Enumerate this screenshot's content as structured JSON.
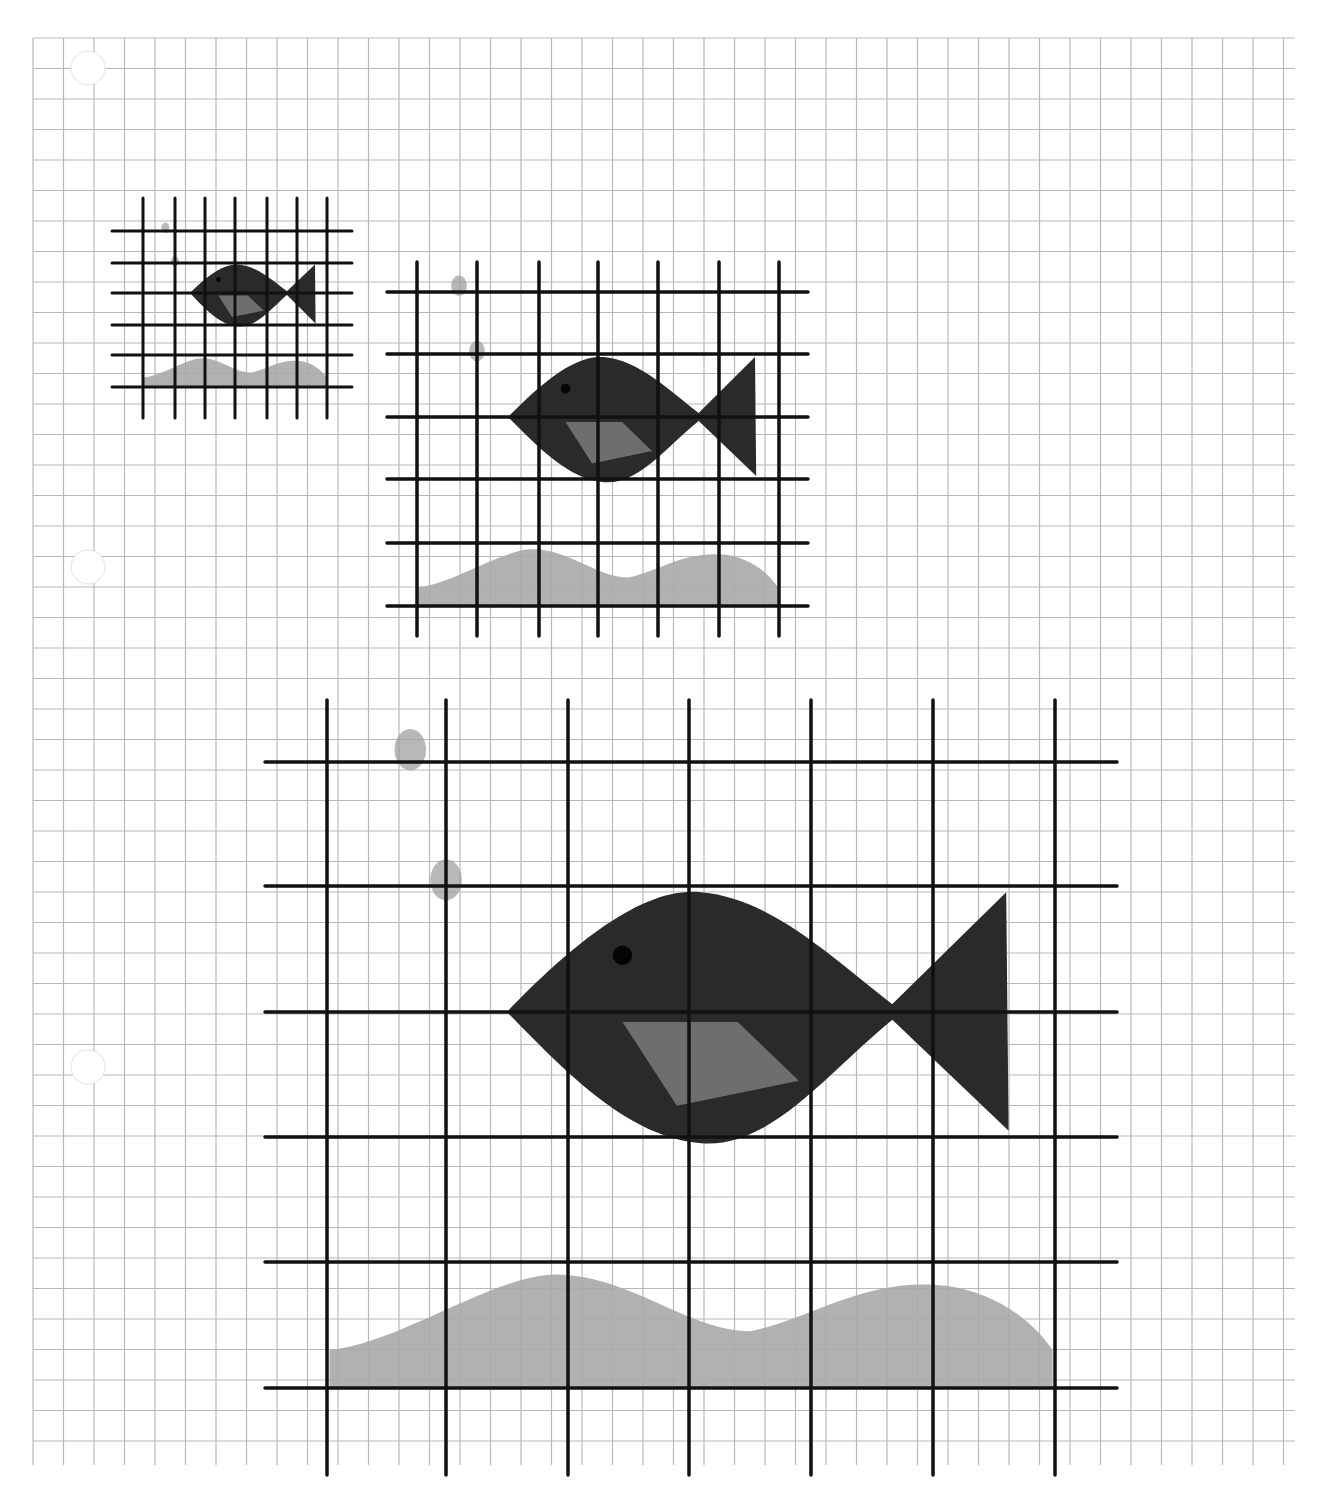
{
  "page": {
    "width": 1327,
    "height": 1496,
    "paper_color": "#ffffff"
  },
  "colors": {
    "paper_grid": "#b8b8b8",
    "bold_grid": "#111111",
    "fish_body": "#2a2a2a",
    "fish_fin_patch": "#6e6e6e",
    "fish_eye": "#050505",
    "sand": "#a9a9a9",
    "bubble": "#9a9a9a",
    "hole": "#ffffff"
  },
  "paper_grid": {
    "x0": 33,
    "y0": 38,
    "x1": 1295,
    "y1": 1465,
    "cell": 30.5
  },
  "holes": [
    {
      "cx": 88,
      "cy": 68,
      "r": 17
    },
    {
      "cx": 88,
      "cy": 567,
      "r": 17
    },
    {
      "cx": 88,
      "cy": 1067,
      "r": 17
    }
  ],
  "drawings": [
    {
      "name": "small",
      "scale": 1,
      "verticals": [
        143,
        175,
        205,
        235,
        267,
        297,
        327
      ],
      "v_range": [
        198,
        418
      ],
      "horizontals": [
        231,
        263,
        293,
        325,
        355,
        387
      ],
      "h_range": [
        112,
        352
      ],
      "stroke": 3
    },
    {
      "name": "medium",
      "scale": 2,
      "verticals": [
        417,
        477,
        539,
        598,
        658,
        719,
        779
      ],
      "v_range": [
        262,
        636
      ],
      "horizontals": [
        292,
        354,
        417,
        479,
        543,
        606
      ],
      "h_range": [
        387,
        808
      ],
      "stroke": 3.5
    },
    {
      "name": "large",
      "scale": 4,
      "verticals": [
        327,
        446,
        568,
        689,
        811,
        933,
        1055
      ],
      "v_range": [
        700,
        1475
      ],
      "horizontals": [
        762,
        886,
        1012,
        1137,
        1262,
        1388
      ],
      "h_range": [
        265,
        1117
      ],
      "stroke": 3.5
    }
  ]
}
